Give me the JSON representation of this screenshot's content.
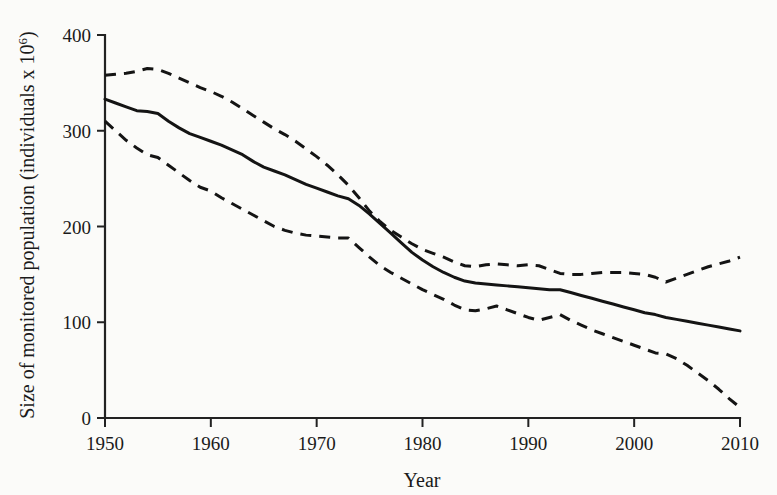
{
  "chart_data": {
    "type": "line",
    "title": "",
    "xlabel": "Year",
    "ylabel": "Size of monitored population (individuals x 10",
    "ylabel_superscript": "6",
    "ylabel_suffix": ")",
    "xlim": [
      1950,
      2010
    ],
    "ylim": [
      0,
      400
    ],
    "xticks": [
      1950,
      1960,
      1970,
      1980,
      1990,
      2000,
      2010
    ],
    "xtick_labels": [
      "1950",
      "1960",
      "1970",
      "1980",
      "1990",
      "2000",
      "2010"
    ],
    "yticks": [
      0,
      100,
      200,
      300,
      400
    ],
    "ytick_labels": [
      "0",
      "100",
      "200",
      "300",
      "400"
    ],
    "grid": false,
    "legend": "none",
    "x": [
      1950,
      1951,
      1952,
      1953,
      1954,
      1955,
      1956,
      1957,
      1958,
      1959,
      1960,
      1961,
      1962,
      1963,
      1964,
      1965,
      1966,
      1967,
      1968,
      1969,
      1970,
      1971,
      1972,
      1973,
      1974,
      1975,
      1976,
      1977,
      1978,
      1979,
      1980,
      1981,
      1982,
      1983,
      1984,
      1985,
      1986,
      1987,
      1988,
      1989,
      1990,
      1991,
      1992,
      1993,
      1994,
      1995,
      1996,
      1997,
      1998,
      1999,
      2000,
      2001,
      2002,
      2003,
      2004,
      2005,
      2006,
      2007,
      2008,
      2009,
      2010
    ],
    "series": [
      {
        "name": "Mean monitored population size",
        "style": "solid",
        "color": "#141414",
        "values": [
          333,
          329,
          325,
          321,
          320,
          318,
          310,
          303,
          297,
          293,
          289,
          285,
          280,
          275,
          268,
          262,
          258,
          254,
          249,
          244,
          240,
          236,
          232,
          229,
          222,
          213,
          203,
          193,
          183,
          173,
          165,
          158,
          152,
          147,
          143,
          141,
          140,
          139,
          138,
          137,
          136,
          135,
          134,
          134,
          131,
          128,
          125,
          122,
          119,
          116,
          113,
          110,
          108,
          105,
          103,
          101,
          99,
          97,
          95,
          93,
          91
        ]
      },
      {
        "name": "Upper confidence limit",
        "style": "dashed",
        "color": "#141414",
        "values": [
          358,
          359,
          360,
          362,
          365,
          364,
          360,
          355,
          350,
          345,
          341,
          336,
          330,
          323,
          316,
          309,
          302,
          296,
          289,
          281,
          273,
          264,
          254,
          243,
          230,
          216,
          205,
          196,
          189,
          182,
          176,
          172,
          168,
          163,
          159,
          158,
          160,
          161,
          160,
          159,
          160,
          159,
          155,
          151,
          150,
          150,
          151,
          152,
          152,
          152,
          151,
          150,
          147,
          142,
          146,
          150,
          154,
          158,
          161,
          164,
          168
        ]
      },
      {
        "name": "Lower confidence limit",
        "style": "dashed",
        "color": "#141414",
        "values": [
          310,
          300,
          290,
          282,
          275,
          272,
          264,
          256,
          248,
          241,
          237,
          230,
          224,
          218,
          212,
          206,
          200,
          196,
          193,
          191,
          190,
          189,
          188,
          188,
          178,
          168,
          159,
          152,
          146,
          140,
          134,
          129,
          124,
          118,
          113,
          112,
          114,
          117,
          113,
          109,
          105,
          102,
          105,
          108,
          102,
          97,
          92,
          88,
          84,
          80,
          76,
          72,
          68,
          67,
          62,
          55,
          47,
          39,
          30,
          20,
          11
        ]
      }
    ]
  },
  "figure": {
    "background_color": "#fbfbf9",
    "ink_color": "#141414"
  }
}
